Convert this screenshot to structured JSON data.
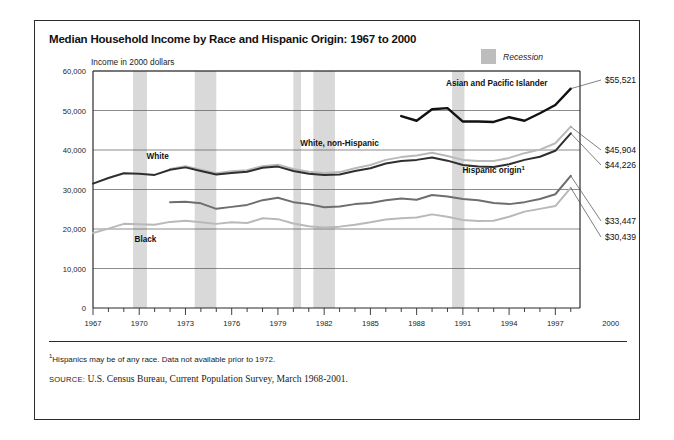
{
  "figure": {
    "title": "Median Household Income by Race and Hispanic Origin: 1967 to 2000",
    "unit_label": "Income in 2000 dollars",
    "legend_recession": "Recession",
    "footnote": "Hispanics may be of any race. Data not available prior to 1972.",
    "footnote_marker": "1",
    "source_label": "SOURCE:",
    "source_text": "U.S. Census Bureau, Current Population Survey, March 1968-2001.",
    "detached_x_label": "2000"
  },
  "colors": {
    "white_series": "#2f2f2f",
    "white_non_hispanic_series": "#b9b9b9",
    "black_series": "#b9b9b9",
    "hispanic_series": "#6e6e6e",
    "asian_series": "#111111",
    "recession_band": "#d9d9d9",
    "gridline": "#5a5a5a",
    "axis": "#2b2b2b"
  },
  "chart_data": {
    "type": "line",
    "title": "Median Household Income by Race and Hispanic Origin: 1967 to 2000",
    "xlabel": "",
    "ylabel": "Income in 2000 dollars",
    "xlim": [
      1967,
      2000
    ],
    "ylim": [
      0,
      60000
    ],
    "grid": true,
    "legend_position": "inline-labels",
    "ytick_labels": [
      "0",
      "10,000",
      "20,000",
      "30,000",
      "40,000",
      "50,000",
      "60,000"
    ],
    "ytick_values": [
      0,
      10000,
      20000,
      30000,
      40000,
      50000,
      60000
    ],
    "xtick_labels": [
      "1967",
      "1970",
      "1973",
      "1976",
      "1979",
      "1982",
      "1985",
      "1988",
      "1991",
      "1994",
      "1997"
    ],
    "xtick_values": [
      1967,
      1970,
      1973,
      1976,
      1979,
      1982,
      1985,
      1988,
      1991,
      1994,
      1997
    ],
    "x_minor_step": 1,
    "recessions": [
      {
        "start": 1969.6,
        "end": 1970.5
      },
      {
        "start": 1973.6,
        "end": 1975.0
      },
      {
        "start": 1980.0,
        "end": 1980.5
      },
      {
        "start": 1981.3,
        "end": 1982.7
      },
      {
        "start": 1990.3,
        "end": 1991.1
      }
    ],
    "series": [
      {
        "name": "White",
        "label": "White",
        "color": "#2f2f2f",
        "end_value_label": "$44,226",
        "end_value": 44226,
        "x": [
          1967,
          1968,
          1969,
          1970,
          1971,
          1972,
          1973,
          1974,
          1975,
          1976,
          1977,
          1978,
          1979,
          1980,
          1981,
          1982,
          1983,
          1984,
          1985,
          1986,
          1987,
          1988,
          1989,
          1990,
          1991,
          1992,
          1993,
          1994,
          1995,
          1996,
          1997,
          1998
        ],
        "values": [
          31500,
          32900,
          34100,
          34000,
          33700,
          35000,
          35600,
          34700,
          33800,
          34200,
          34500,
          35500,
          35800,
          34700,
          34000,
          33700,
          33800,
          34700,
          35400,
          36600,
          37200,
          37500,
          38100,
          37300,
          36200,
          35800,
          35700,
          36400,
          37500,
          38300,
          39800,
          44226
        ]
      },
      {
        "name": "White, non-Hispanic",
        "label": "White, non-Hispanic",
        "color": "#b9b9b9",
        "end_value_label": "$45,904",
        "end_value": 45904,
        "x": [
          1972,
          1973,
          1974,
          1975,
          1976,
          1977,
          1978,
          1979,
          1980,
          1981,
          1982,
          1983,
          1984,
          1985,
          1986,
          1987,
          1988,
          1989,
          1990,
          1991,
          1992,
          1993,
          1994,
          1995,
          1996,
          1997,
          1998
        ],
        "values": [
          35200,
          35900,
          35000,
          34100,
          34600,
          34900,
          35900,
          36300,
          35200,
          34500,
          34200,
          34400,
          35400,
          36200,
          37500,
          38200,
          38600,
          39300,
          38500,
          37500,
          37200,
          37200,
          38000,
          39200,
          40100,
          41700,
          45904
        ]
      },
      {
        "name": "Black",
        "label": "Black",
        "color": "#b9b9b9",
        "end_value_label": "$30,439",
        "end_value": 30439,
        "x": [
          1967,
          1968,
          1969,
          1970,
          1971,
          1972,
          1973,
          1974,
          1975,
          1976,
          1977,
          1978,
          1979,
          1980,
          1981,
          1982,
          1983,
          1984,
          1985,
          1986,
          1987,
          1988,
          1989,
          1990,
          1991,
          1992,
          1993,
          1994,
          1995,
          1996,
          1997,
          1998
        ],
        "values": [
          19000,
          20100,
          21300,
          21200,
          21100,
          21800,
          22100,
          21700,
          21300,
          21700,
          21500,
          22700,
          22500,
          21400,
          20700,
          20400,
          20600,
          21100,
          21700,
          22400,
          22700,
          22900,
          23700,
          23100,
          22300,
          22000,
          22100,
          23100,
          24400,
          25100,
          25800,
          30439
        ]
      },
      {
        "name": "Hispanic origin",
        "label": "Hispanic origin",
        "color": "#6e6e6e",
        "end_value_label": "$33,447",
        "end_value": 33447,
        "label_has_footnote": true,
        "x": [
          1972,
          1973,
          1974,
          1975,
          1976,
          1977,
          1978,
          1979,
          1980,
          1981,
          1982,
          1983,
          1984,
          1985,
          1986,
          1987,
          1988,
          1989,
          1990,
          1991,
          1992,
          1993,
          1994,
          1995,
          1996,
          1997,
          1998
        ],
        "values": [
          26800,
          26900,
          26500,
          25100,
          25600,
          26100,
          27300,
          27900,
          26800,
          26300,
          25500,
          25700,
          26300,
          26600,
          27300,
          27700,
          27400,
          28600,
          28200,
          27600,
          27300,
          26600,
          26300,
          26800,
          27600,
          28800,
          33447
        ]
      },
      {
        "name": "Asian and Pacific Islander",
        "label": "Asian and Pacific Islander",
        "color": "#111111",
        "end_value_label": "$55,521",
        "end_value": 55521,
        "x": [
          1987,
          1988,
          1989,
          1990,
          1991,
          1992,
          1993,
          1994,
          1995,
          1996,
          1997,
          1998
        ],
        "values": [
          48600,
          47400,
          50300,
          50600,
          47200,
          47200,
          47100,
          48300,
          47400,
          49300,
          51400,
          55521
        ]
      }
    ],
    "inline_labels": [
      {
        "text": "White",
        "x": 1971.2,
        "y": 37600
      },
      {
        "text": "Black",
        "x": 1970.4,
        "y": 16600
      },
      {
        "text": "White, non-Hispanic",
        "x": 1983.0,
        "y": 40900
      },
      {
        "text": "Asian and Pacific Islander",
        "x": 1993.2,
        "y": 56200
      },
      {
        "text": "Hispanic origin",
        "x": 1993.0,
        "y": 34300,
        "footnote": true
      }
    ]
  }
}
